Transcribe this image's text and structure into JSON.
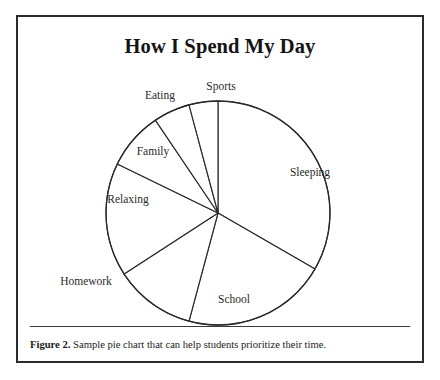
{
  "figure": {
    "title": "How I Spend My Day",
    "caption_label": "Figure 2.",
    "caption_text": " Sample pie chart that can help students prioritize their time."
  },
  "style": {
    "frame_color": "#2b2b2b",
    "line_color": "#2a2a2a",
    "slice_fill": "#ffffff",
    "text_color": "#1b1b1b",
    "background": "#ffffff"
  },
  "chart_data": {
    "type": "pie",
    "title": "How I Spend My Day",
    "xlabel": "",
    "ylabel": "",
    "grid": false,
    "legend": "none",
    "labels_position": "around-slices",
    "start_angle_deg": 0,
    "direction": "clockwise",
    "center": {
      "x": 200,
      "y": 196
    },
    "radius": 112,
    "total_units": "hours per day",
    "categories": [
      "Sleeping",
      "School",
      "Homework",
      "Relaxing",
      "Family",
      "Eating",
      "Sports"
    ],
    "values": [
      8.0,
      5.0,
      2.8,
      3.9,
      2.2,
      1.0,
      0.7
    ],
    "percentages": [
      33.3,
      20.8,
      11.7,
      16.3,
      9.2,
      4.2,
      2.9
    ],
    "slices": [
      {
        "label": "Sleeping",
        "value": 8.0,
        "percent": 33.3,
        "start_angle_deg": 0,
        "end_angle_deg": 120,
        "label_x": 292,
        "label_y": 156
      },
      {
        "label": "School",
        "value": 5.0,
        "percent": 20.8,
        "start_angle_deg": 120,
        "end_angle_deg": 195,
        "label_x": 216,
        "label_y": 283
      },
      {
        "label": "Homework",
        "value": 2.8,
        "percent": 11.7,
        "start_angle_deg": 195,
        "end_angle_deg": 237,
        "label_x": 68,
        "label_y": 265
      },
      {
        "label": "Relaxing",
        "value": 3.9,
        "percent": 16.3,
        "start_angle_deg": 237,
        "end_angle_deg": 296,
        "label_x": 110,
        "label_y": 183
      },
      {
        "label": "Family",
        "value": 2.2,
        "percent": 9.2,
        "start_angle_deg": 296,
        "end_angle_deg": 326,
        "label_x": 135,
        "label_y": 135
      },
      {
        "label": "Eating",
        "value": 1.0,
        "percent": 4.2,
        "start_angle_deg": 326,
        "end_angle_deg": 345,
        "label_x": 142,
        "label_y": 79
      },
      {
        "label": "Sports",
        "value": 0.7,
        "percent": 2.9,
        "start_angle_deg": 345,
        "end_angle_deg": 360,
        "label_x": 203,
        "label_y": 70
      }
    ]
  }
}
